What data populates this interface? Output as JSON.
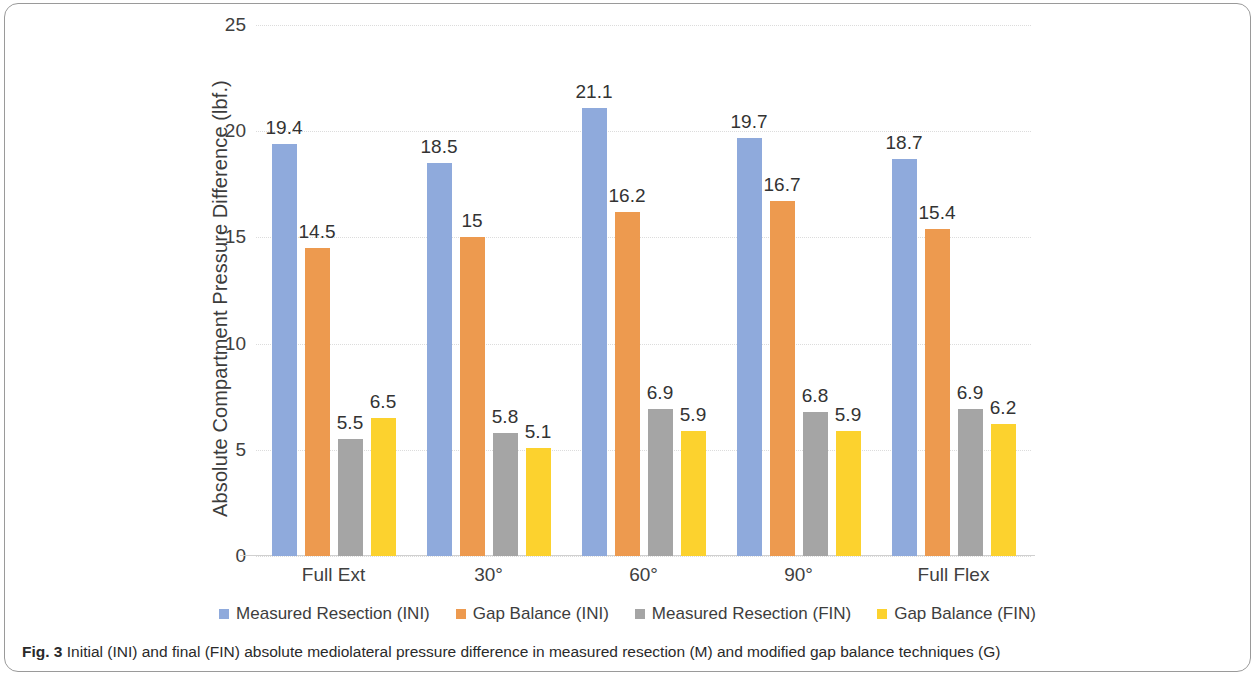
{
  "figure": {
    "caption_prefix": "Fig. 3",
    "caption_text": "Initial (INI) and final (FIN) absolute mediolateral pressure difference in measured resection (M) and modified gap balance techniques (G)"
  },
  "colors": {
    "series_1": "#8FAADC",
    "series_2": "#ED9A4F",
    "series_3": "#A5A5A5",
    "series_4": "#FCD22E",
    "grid": "#dcdcdc",
    "axis": "#d0d0d0",
    "text": "#3c3c3c",
    "frame": "#9a9a9a"
  },
  "chart_data": {
    "type": "bar",
    "title": "",
    "xlabel": "",
    "ylabel": "Absolute Compartment Pressure Difference (lbf.)",
    "ylim": [
      0,
      25
    ],
    "yticks": [
      0,
      5,
      10,
      15,
      20,
      25
    ],
    "ytick_labels": [
      "0",
      "5",
      "10",
      "15",
      "20",
      "25"
    ],
    "grid": true,
    "legend_position": "bottom",
    "categories": [
      "Full Ext",
      "30°",
      "60°",
      "90°",
      "Full Flex"
    ],
    "series": [
      {
        "name": "Measured Resection (INI)",
        "color": "#8FAADC",
        "values": [
          19.4,
          18.5,
          21.1,
          19.7,
          18.7
        ],
        "labels": [
          "19.4",
          "18.5",
          "21.1",
          "19.7",
          "18.7"
        ]
      },
      {
        "name": "Gap Balance (INI)",
        "color": "#ED9A4F",
        "values": [
          14.5,
          15,
          16.2,
          16.7,
          15.4
        ],
        "labels": [
          "14.5",
          "15",
          "16.2",
          "16.7",
          "15.4"
        ]
      },
      {
        "name": "Measured Resection (FIN)",
        "color": "#A5A5A5",
        "values": [
          5.5,
          5.8,
          6.9,
          6.8,
          6.9
        ],
        "labels": [
          "5.5",
          "5.8",
          "6.9",
          "6.8",
          "6.9"
        ]
      },
      {
        "name": "Gap Balance (FIN)",
        "color": "#FCD22E",
        "values": [
          6.5,
          5.1,
          5.9,
          5.9,
          6.2
        ],
        "labels": [
          "6.5",
          "5.1",
          "5.9",
          "5.9",
          "6.2"
        ]
      }
    ]
  }
}
